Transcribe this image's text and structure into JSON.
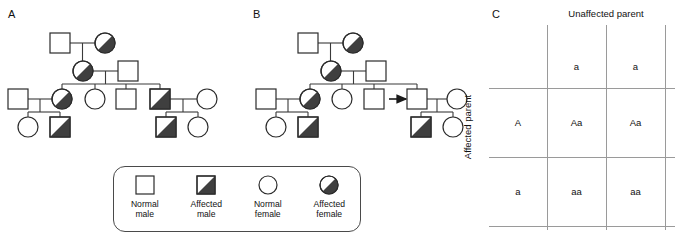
{
  "panels": {
    "a": {
      "label": "A"
    },
    "b": {
      "label": "B"
    },
    "c": {
      "label": "C"
    }
  },
  "legend": {
    "items": [
      {
        "name": "normal-male",
        "line1": "Normal",
        "line2": "male",
        "shape": "square",
        "status": "normal"
      },
      {
        "name": "affected-male",
        "line1": "Affected",
        "line2": "male",
        "shape": "square",
        "status": "affected"
      },
      {
        "name": "normal-female",
        "line1": "Normal",
        "line2": "female",
        "shape": "circle",
        "status": "normal"
      },
      {
        "name": "affected-female",
        "line1": "Affected",
        "line2": "female",
        "shape": "circle",
        "status": "affected"
      }
    ]
  },
  "punnett": {
    "column_header": "Unaffected parent",
    "row_header": "Affected parent",
    "col_alleles": [
      "a",
      "a"
    ],
    "row_alleles": [
      "A",
      "a"
    ],
    "cells": [
      [
        "Aa",
        "Aa"
      ],
      [
        "aa",
        "aa"
      ]
    ]
  },
  "colors": {
    "affected_fill": "#3f3f3f",
    "normal_fill": "#ffffff",
    "symbol_stroke": "#2b2b2b",
    "line": "#3a3a3a",
    "grid": "#9a9a9a",
    "text": "#111111"
  },
  "pedigree_a": {
    "description": "Four-generation pedigree with complete penetrance",
    "individuals": [
      {
        "id": "I-1",
        "shape": "square",
        "status": "normal",
        "x": 60,
        "y": 43
      },
      {
        "id": "I-2",
        "shape": "circle",
        "status": "affected",
        "x": 105,
        "y": 43
      },
      {
        "id": "II-1",
        "shape": "circle",
        "status": "affected",
        "x": 83,
        "y": 71
      },
      {
        "id": "II-2",
        "shape": "square",
        "status": "normal",
        "x": 128,
        "y": 71
      },
      {
        "id": "III-1",
        "shape": "square",
        "status": "normal",
        "x": 18,
        "y": 99
      },
      {
        "id": "III-2",
        "shape": "circle",
        "status": "affected",
        "x": 62,
        "y": 99
      },
      {
        "id": "III-3",
        "shape": "circle",
        "status": "normal",
        "x": 95,
        "y": 99
      },
      {
        "id": "III-4",
        "shape": "square",
        "status": "normal",
        "x": 126,
        "y": 99
      },
      {
        "id": "III-5",
        "shape": "square",
        "status": "affected",
        "x": 160,
        "y": 99
      },
      {
        "id": "III-6",
        "shape": "circle",
        "status": "normal",
        "x": 207,
        "y": 99
      },
      {
        "id": "IV-1",
        "shape": "circle",
        "status": "normal",
        "x": 28,
        "y": 127
      },
      {
        "id": "IV-2",
        "shape": "square",
        "status": "affected",
        "x": 60,
        "y": 127
      },
      {
        "id": "IV-3",
        "shape": "square",
        "status": "affected",
        "x": 166,
        "y": 127
      },
      {
        "id": "IV-4",
        "shape": "circle",
        "status": "normal",
        "x": 198,
        "y": 127
      }
    ]
  },
  "pedigree_b": {
    "description": "Same pedigree with an unaffected carrier indicated by an arrow (incomplete penetrance)",
    "arrow": {
      "from_x": 393,
      "to_x": 411,
      "y": 89,
      "points": "right"
    },
    "individuals": [
      {
        "id": "I-1",
        "shape": "square",
        "status": "normal",
        "x": 308,
        "y": 43
      },
      {
        "id": "I-2",
        "shape": "circle",
        "status": "affected",
        "x": 353,
        "y": 43
      },
      {
        "id": "II-1",
        "shape": "circle",
        "status": "affected",
        "x": 330,
        "y": 71
      },
      {
        "id": "II-2",
        "shape": "square",
        "status": "normal",
        "x": 375,
        "y": 71
      },
      {
        "id": "III-1",
        "shape": "square",
        "status": "normal",
        "x": 266,
        "y": 99
      },
      {
        "id": "III-2",
        "shape": "circle",
        "status": "affected",
        "x": 310,
        "y": 99
      },
      {
        "id": "III-3",
        "shape": "circle",
        "status": "normal",
        "x": 342,
        "y": 99
      },
      {
        "id": "III-4",
        "shape": "square",
        "status": "normal",
        "x": 374,
        "y": 99
      },
      {
        "id": "III-5",
        "shape": "square",
        "status": "normal",
        "x": 417,
        "y": 99
      },
      {
        "id": "III-6",
        "shape": "circle",
        "status": "normal",
        "x": 457,
        "y": 99
      },
      {
        "id": "IV-1",
        "shape": "circle",
        "status": "normal",
        "x": 276,
        "y": 127
      },
      {
        "id": "IV-2",
        "shape": "square",
        "status": "affected",
        "x": 308,
        "y": 127
      },
      {
        "id": "IV-3",
        "shape": "square",
        "status": "affected",
        "x": 421,
        "y": 127
      },
      {
        "id": "IV-4",
        "shape": "circle",
        "status": "normal",
        "x": 453,
        "y": 127
      }
    ]
  }
}
